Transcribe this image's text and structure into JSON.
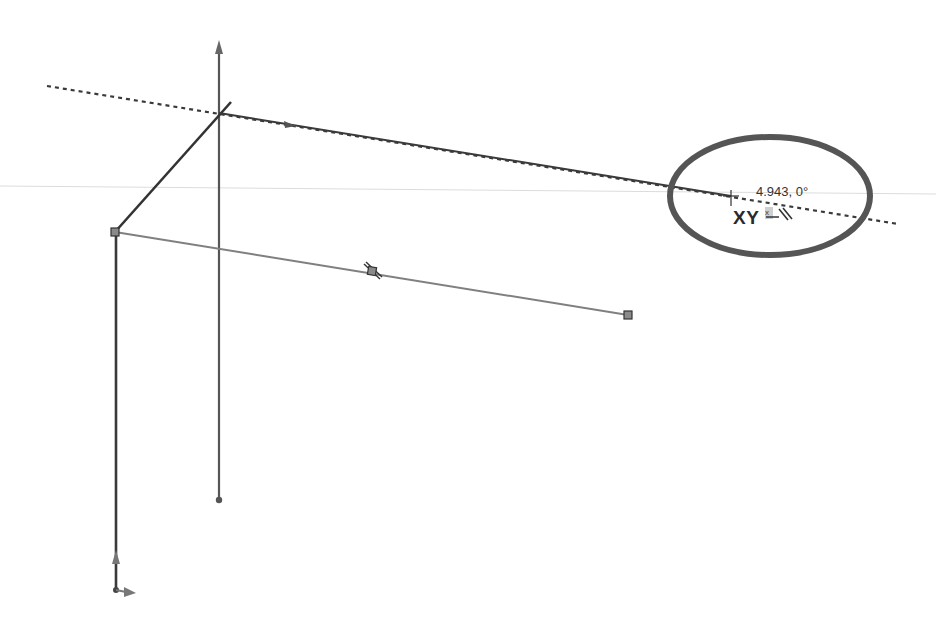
{
  "app": {
    "view": "3D sketch viewport"
  },
  "colors": {
    "background": "#ffffff",
    "sketch_line_dark": "#3a3a3a",
    "sketch_line_gray": "#7a7a7a",
    "inference_line": "#3a3a3a",
    "highlight_ellipse": "#555555",
    "endpoint_fill": "#8a8a8a",
    "horizon_line": "#d8d8d8"
  },
  "cursor_feedback": {
    "dimension_text": "4.943, 0°",
    "plane_label": "XY",
    "relation_icon": "along-x-parallel-icon"
  },
  "sketch": {
    "points": {
      "origin_top": [
        219,
        113
      ],
      "left_corner": [
        115,
        232
      ],
      "midpoint": [
        372,
        271
      ],
      "right_endpoint": [
        628,
        315
      ],
      "cursor": [
        731,
        196
      ],
      "vertical_bottom": [
        219,
        500
      ],
      "origin_bottom": [
        116,
        590
      ]
    }
  }
}
